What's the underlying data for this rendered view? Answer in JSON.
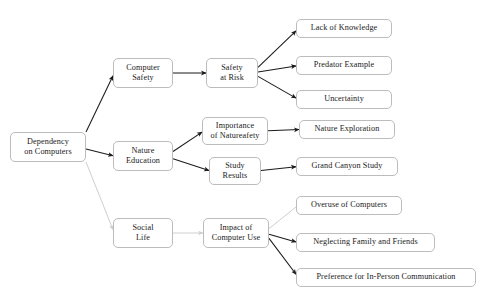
{
  "diagram": {
    "type": "flowchart",
    "background_color": "#ffffff",
    "node_fill": "#ffffff",
    "node_border_color": "#bcbcbc",
    "edge_color_dark": "#1a1a1a",
    "edge_color_faint": "#cfcfcf",
    "text_color": "#1a1a1a",
    "nodes": [
      {
        "id": "root",
        "label": "Dependency\non Computers",
        "x": 10,
        "y": 132,
        "w": 76,
        "h": 30
      },
      {
        "id": "comp_safety",
        "label": "Computer\nSafety",
        "x": 113,
        "y": 58,
        "w": 60,
        "h": 30
      },
      {
        "id": "safety_risk",
        "label": "Safety\nat Risk",
        "x": 206,
        "y": 58,
        "w": 52,
        "h": 30
      },
      {
        "id": "lack",
        "label": "Lack of Knowledge",
        "x": 296,
        "y": 19,
        "w": 96,
        "h": 19
      },
      {
        "id": "predator",
        "label": "Predator Example",
        "x": 296,
        "y": 56,
        "w": 96,
        "h": 19
      },
      {
        "id": "uncertainty",
        "label": "Uncertainty",
        "x": 296,
        "y": 90,
        "w": 96,
        "h": 19
      },
      {
        "id": "nature_edu",
        "label": "Nature\nEducation",
        "x": 113,
        "y": 141,
        "w": 60,
        "h": 30
      },
      {
        "id": "importance",
        "label": "Importance\nof Natureafety",
        "x": 202,
        "y": 117,
        "w": 66,
        "h": 28
      },
      {
        "id": "study",
        "label": "Study\nResults",
        "x": 209,
        "y": 157,
        "w": 52,
        "h": 28
      },
      {
        "id": "nature_exp",
        "label": "Nature Exploration",
        "x": 299,
        "y": 120,
        "w": 96,
        "h": 19
      },
      {
        "id": "grand",
        "label": "Grand Canyon Study",
        "x": 296,
        "y": 157,
        "w": 102,
        "h": 19
      },
      {
        "id": "social",
        "label": "Social\nLife",
        "x": 113,
        "y": 218,
        "w": 60,
        "h": 30
      },
      {
        "id": "impact",
        "label": "Impact of\nComputer Use",
        "x": 203,
        "y": 218,
        "w": 66,
        "h": 30
      },
      {
        "id": "overuse",
        "label": "Overuse of Computers",
        "x": 296,
        "y": 196,
        "w": 106,
        "h": 19
      },
      {
        "id": "neglect",
        "label": "Neglecting Family and Friends",
        "x": 296,
        "y": 233,
        "w": 139,
        "h": 19
      },
      {
        "id": "preference",
        "label": "Preference for In-Person Communication",
        "x": 296,
        "y": 268,
        "w": 180,
        "h": 19
      }
    ],
    "edges": [
      {
        "from": "root",
        "to": "comp_safety",
        "style": "dark",
        "arrow": true
      },
      {
        "from": "root",
        "to": "nature_edu",
        "style": "dark",
        "arrow": true
      },
      {
        "from": "root",
        "to": "social",
        "style": "faint",
        "arrow": true
      },
      {
        "from": "comp_safety",
        "to": "safety_risk",
        "style": "dark",
        "arrow": true
      },
      {
        "from": "safety_risk",
        "to": "lack",
        "style": "dark",
        "arrow": true
      },
      {
        "from": "safety_risk",
        "to": "predator",
        "style": "dark",
        "arrow": true
      },
      {
        "from": "safety_risk",
        "to": "uncertainty",
        "style": "dark",
        "arrow": true
      },
      {
        "from": "nature_edu",
        "to": "importance",
        "style": "dark",
        "arrow": true
      },
      {
        "from": "nature_edu",
        "to": "study",
        "style": "dark",
        "arrow": true
      },
      {
        "from": "importance",
        "to": "nature_exp",
        "style": "dark",
        "arrow": true
      },
      {
        "from": "study",
        "to": "grand",
        "style": "dark",
        "arrow": true
      },
      {
        "from": "social",
        "to": "impact",
        "style": "faint",
        "arrow": true
      },
      {
        "from": "impact",
        "to": "overuse",
        "style": "faint",
        "arrow": false
      },
      {
        "from": "impact",
        "to": "neglect",
        "style": "dark",
        "arrow": true
      },
      {
        "from": "impact",
        "to": "preference",
        "style": "dark",
        "arrow": true
      }
    ]
  }
}
